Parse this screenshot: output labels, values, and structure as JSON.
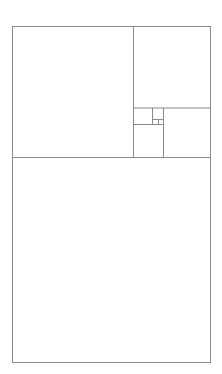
{
  "diagram": {
    "type": "golden-rectangle-subdivision",
    "canvas": {
      "width": 222,
      "height": 374
    },
    "stroke_color": "#8a8a8a",
    "background": "#ffffff",
    "outer": {
      "x": 12,
      "y": 26,
      "w": 198,
      "h": 336
    },
    "lines": [
      {
        "id": "h-main-divider",
        "x1": 12,
        "y1": 157,
        "x2": 210,
        "y2": 157
      },
      {
        "id": "v-bigsquare-right",
        "x1": 133,
        "y1": 26,
        "x2": 133,
        "y2": 157
      },
      {
        "id": "h-topright-bottom",
        "x1": 133,
        "y1": 107.5,
        "x2": 210,
        "y2": 107.5
      },
      {
        "id": "v-rightsquare-left",
        "x1": 163,
        "y1": 107.5,
        "x2": 163,
        "y2": 157
      },
      {
        "id": "h-small-bottom",
        "x1": 133,
        "y1": 124,
        "x2": 163,
        "y2": 124
      },
      {
        "id": "v-small-right",
        "x1": 152,
        "y1": 107.5,
        "x2": 152,
        "y2": 124
      },
      {
        "id": "h-tiny",
        "x1": 152,
        "y1": 119,
        "x2": 163,
        "y2": 119
      },
      {
        "id": "v-tiny",
        "x1": 158,
        "y1": 119,
        "x2": 158,
        "y2": 124
      }
    ]
  }
}
